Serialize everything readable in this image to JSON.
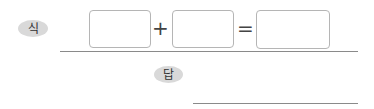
{
  "formula": {
    "label": "식",
    "operator_plus": "+",
    "operator_equal": "=",
    "boxes": [
      {
        "value": ""
      },
      {
        "value": ""
      },
      {
        "value": ""
      }
    ]
  },
  "answer": {
    "label": "답",
    "value": ""
  },
  "colors": {
    "badge_bg": "#d9d9d9",
    "box_border": "#b5b5b5",
    "rule": "#8a8a8a",
    "operator": "#444444"
  }
}
